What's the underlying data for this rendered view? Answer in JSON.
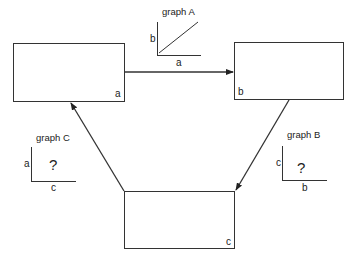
{
  "boxes": {
    "a": {
      "label": "a"
    },
    "b": {
      "label": "b"
    },
    "c": {
      "label": "c"
    }
  },
  "graphs": {
    "A": {
      "title": "graph A",
      "y_label": "b",
      "x_label": "a",
      "relation": "linear-increasing",
      "mark": ""
    },
    "B": {
      "title": "graph B",
      "y_label": "c",
      "x_label": "b",
      "relation": "unknown",
      "mark": "?"
    },
    "C": {
      "title": "graph C",
      "y_label": "a",
      "x_label": "c",
      "relation": "unknown",
      "mark": "?"
    }
  },
  "arrows": [
    {
      "from": "a",
      "to": "b"
    },
    {
      "from": "b",
      "to": "c"
    },
    {
      "from": "c",
      "to": "a"
    }
  ]
}
